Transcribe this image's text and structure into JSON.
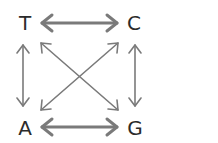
{
  "diagram": {
    "nodes": [
      {
        "id": "T",
        "label": "T"
      },
      {
        "id": "C",
        "label": "C"
      },
      {
        "id": "A",
        "label": "A"
      },
      {
        "id": "G",
        "label": "G"
      }
    ],
    "edges": [
      {
        "from": "T",
        "to": "C",
        "type": "bidirectional",
        "style": "thick"
      },
      {
        "from": "A",
        "to": "G",
        "type": "bidirectional",
        "style": "thick"
      },
      {
        "from": "T",
        "to": "A",
        "type": "bidirectional",
        "style": "thin"
      },
      {
        "from": "C",
        "to": "G",
        "type": "bidirectional",
        "style": "thin"
      },
      {
        "from": "T",
        "to": "G",
        "type": "bidirectional",
        "style": "thin"
      },
      {
        "from": "C",
        "to": "A",
        "type": "bidirectional",
        "style": "thin"
      }
    ],
    "colors": {
      "arrow": "#7a7a7a",
      "text": "#2b2b2b"
    }
  }
}
